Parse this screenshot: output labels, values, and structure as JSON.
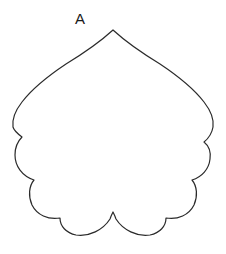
{
  "figure": {
    "panel_label": "A",
    "label_position": {
      "x": 75,
      "y": 24
    },
    "background_color": "#ffffff",
    "stroke_color": "#2b2b2b",
    "stroke_width": 1.2,
    "fill": "none",
    "shape_description": "cordate leaf outline with scalloped lobed lower margin and acute apex",
    "canvas": {
      "width": 226,
      "height": 254
    },
    "outline_path": "M 113 30 C 101 41 84 53 66 64 C 48 76 32 89 22 102 C 15 111 12 120 13 127 C 14 131 18 134 22 137 C 18 141 15 147 15 155 C 15 166 22 176 34 180 C 29 186 28 196 32 205 C 37 215 48 220 60 218 C 60 226 66 233 76 235 C 89 237 103 230 110 219 C 111 216 112 214 113 212 C 114 214 115 216 116 219 C 123 230 137 237 150 235 C 160 233 166 226 166 218 C 178 220 189 215 194 205 C 198 196 197 186 192 180 C 202 177 209 169 210 159 C 211 152 209 146 204 142 C 209 138 212 133 213 127 C 214 120 211 111 204 102 C 194 89 178 76 160 64 C 142 53 125 41 113 30 Z",
    "extents": {
      "apex": {
        "x": 113,
        "y": 30
      },
      "leftmost": {
        "x": 13,
        "y": 127
      },
      "rightmost": {
        "x": 213,
        "y": 127
      },
      "bottom": {
        "x": 113,
        "y": 236
      },
      "basal_sinus": {
        "x": 113,
        "y": 212
      }
    },
    "margin_cusps": [
      {
        "x": 22,
        "y": 137,
        "side": "left"
      },
      {
        "x": 34,
        "y": 180,
        "side": "left"
      },
      {
        "x": 60,
        "y": 218,
        "side": "left"
      },
      {
        "x": 113,
        "y": 212,
        "side": "center"
      },
      {
        "x": 166,
        "y": 218,
        "side": "right"
      },
      {
        "x": 192,
        "y": 180,
        "side": "right"
      },
      {
        "x": 204,
        "y": 142,
        "side": "right"
      }
    ]
  }
}
